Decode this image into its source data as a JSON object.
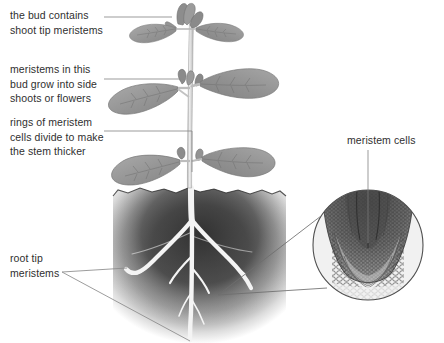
{
  "diagram": {
    "background_color": "#ffffff",
    "text_color": "#2f2f2f",
    "leader_line_color": "#808080"
  },
  "labels": {
    "shoot_tip": {
      "text": "the bud contains\nshoot tip meristems",
      "name": "shoot-tip-meristems-label",
      "points_to": "apical bud at top of stem"
    },
    "side_shoots": {
      "text": "meristems in this\nbud grow into side\nshoots or flowers",
      "name": "axillary-bud-label",
      "points_to": "axillary bud at middle node"
    },
    "stem_rings": {
      "text": "rings of meristem\ncells divide to make\nthe stem thicker",
      "name": "stem-thickening-label",
      "points_to": "stem between nodes"
    },
    "root_tip": {
      "text": "root tip\nmeristems",
      "name": "root-tip-meristems-label",
      "points_to": "two root tips in soil"
    },
    "meristem_cells": {
      "text": "meristem cells",
      "name": "meristem-cells-label",
      "points_to": "dark cell region inside circular micrograph"
    }
  },
  "plant": {
    "name": "plant-illustration",
    "stem_color": "#c9c9c9",
    "leaf_fill": "#9a9a9a",
    "leaf_vein": "#7a7a7a",
    "bud_color": "#8e8e8e",
    "leaf_pairs": 3,
    "bud_count": 3
  },
  "soil": {
    "name": "soil-mass",
    "color_dark": "#3f3f3f",
    "color_fade": "#ffffff",
    "top_y": 188,
    "bottom_y": 338
  },
  "roots": {
    "name": "root-system",
    "color": "#f2f2f2",
    "branches": 5
  },
  "inset": {
    "name": "root-tip-micrograph",
    "shape": "circle",
    "center_x": 368,
    "center_y": 245,
    "radius": 55,
    "border_color": "#555555",
    "tissue_dark": "#595959",
    "tissue_light": "#e8e8e8",
    "description": "longitudinal section of root tip showing meristem cells and root cap"
  }
}
